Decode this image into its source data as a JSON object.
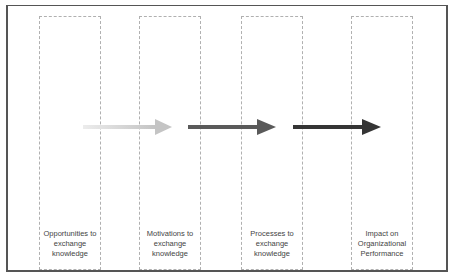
{
  "diagram": {
    "stages": [
      {
        "label": "Opportunities to\nexchange\nknowledge"
      },
      {
        "label": "Motivations to\nexchange\nknowledge"
      },
      {
        "label": "Processes to\nexchange\nknowledge"
      },
      {
        "label": "Impact on\nOrganizational\nPerformance"
      }
    ],
    "arrows": [
      {
        "from": 0,
        "to": 1,
        "color": "#c4c4c4"
      },
      {
        "from": 1,
        "to": 2,
        "color": "#5a5a5a"
      },
      {
        "from": 2,
        "to": 3,
        "color": "#353535"
      }
    ],
    "colors": {
      "frame": "#555555",
      "box_border": "#b0b0b0",
      "text": "#444444"
    }
  }
}
